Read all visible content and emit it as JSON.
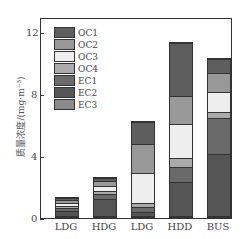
{
  "chart_data": {
    "type": "bar",
    "stacked": true,
    "categories": [
      "LDG",
      "HDG",
      "LDG",
      "HDD",
      "BUS"
    ],
    "ylabel": "质量浓度/(mg·m⁻³)",
    "xlabel": "",
    "ylim": [
      0,
      13
    ],
    "yticks": [
      "0",
      "4",
      "8",
      "12"
    ],
    "series": [
      {
        "name": "EC3",
        "color": "#8a8a8a",
        "values": [
          0.05,
          0.05,
          0.05,
          0.05,
          0.05
        ]
      },
      {
        "name": "EC2",
        "color": "#555555",
        "values": [
          0.35,
          1.1,
          0.25,
          2.2,
          4.0
        ]
      },
      {
        "name": "EC1",
        "color": "#6a6a6a",
        "values": [
          0.15,
          0.3,
          0.3,
          0.95,
          2.35
        ]
      },
      {
        "name": "OC4",
        "color": "#aaaaaa",
        "values": [
          0.15,
          0.2,
          0.3,
          0.6,
          0.4
        ]
      },
      {
        "name": "OC3",
        "color": "#eeeeee",
        "values": [
          0.2,
          0.35,
          1.9,
          2.2,
          1.25
        ]
      },
      {
        "name": "OC2",
        "color": "#999999",
        "values": [
          0.2,
          0.3,
          1.9,
          1.8,
          1.25
        ]
      },
      {
        "name": "OC1",
        "color": "#5e5e5e",
        "values": [
          0.15,
          0.2,
          1.4,
          3.4,
          0.9
        ]
      }
    ],
    "legend": [
      "OC1",
      "OC2",
      "OC3",
      "OC4",
      "EC1",
      "EC2",
      "EC3"
    ],
    "legend_position": "upper left"
  }
}
